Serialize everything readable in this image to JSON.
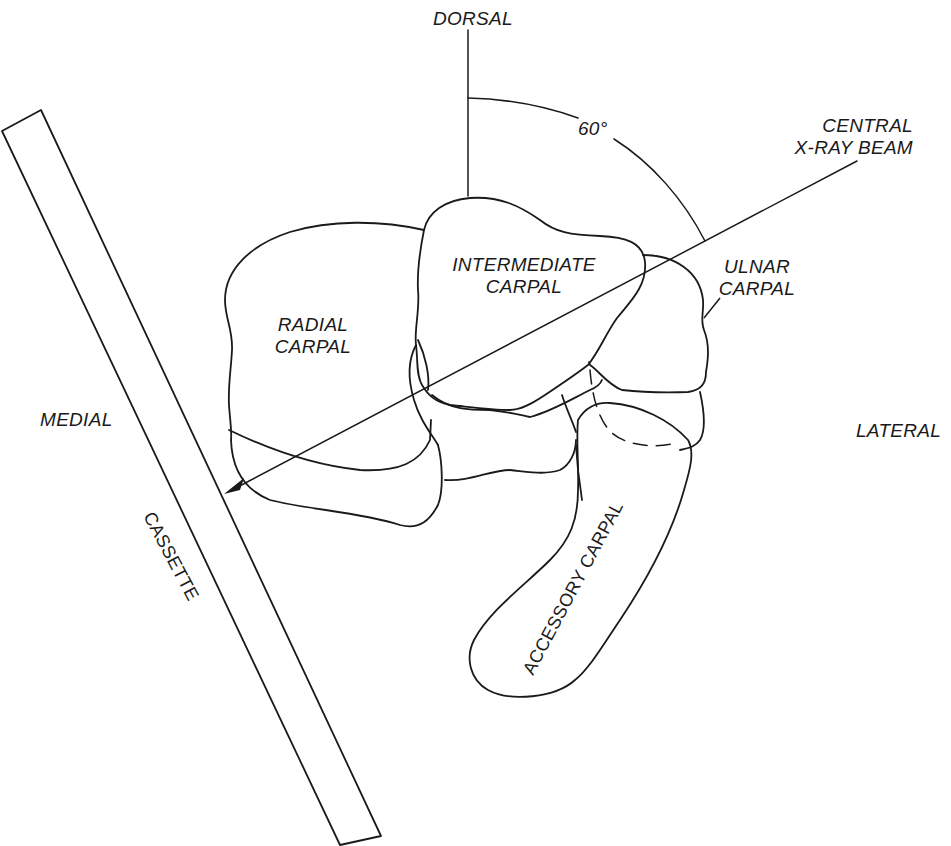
{
  "diagram": {
    "orientation": {
      "dorsal": "DORSAL",
      "medial": "MEDIAL",
      "lateral": "LATERAL"
    },
    "angle": {
      "label": "60°"
    },
    "beam": {
      "line1": "CENTRAL",
      "line2": "X-RAY BEAM"
    },
    "cassette": {
      "label": "CASSETTE"
    },
    "bones": {
      "radial": {
        "line1": "RADIAL",
        "line2": "CARPAL"
      },
      "intermediate": {
        "line1": "INTERMEDIATE",
        "line2": "CARPAL"
      },
      "ulnar": {
        "line1": "ULNAR",
        "line2": "CARPAL"
      },
      "accessory": {
        "label": "ACCESSORY CARPAL"
      }
    },
    "colors": {
      "ink": "#1a1a1a",
      "background": "#ffffff"
    }
  }
}
